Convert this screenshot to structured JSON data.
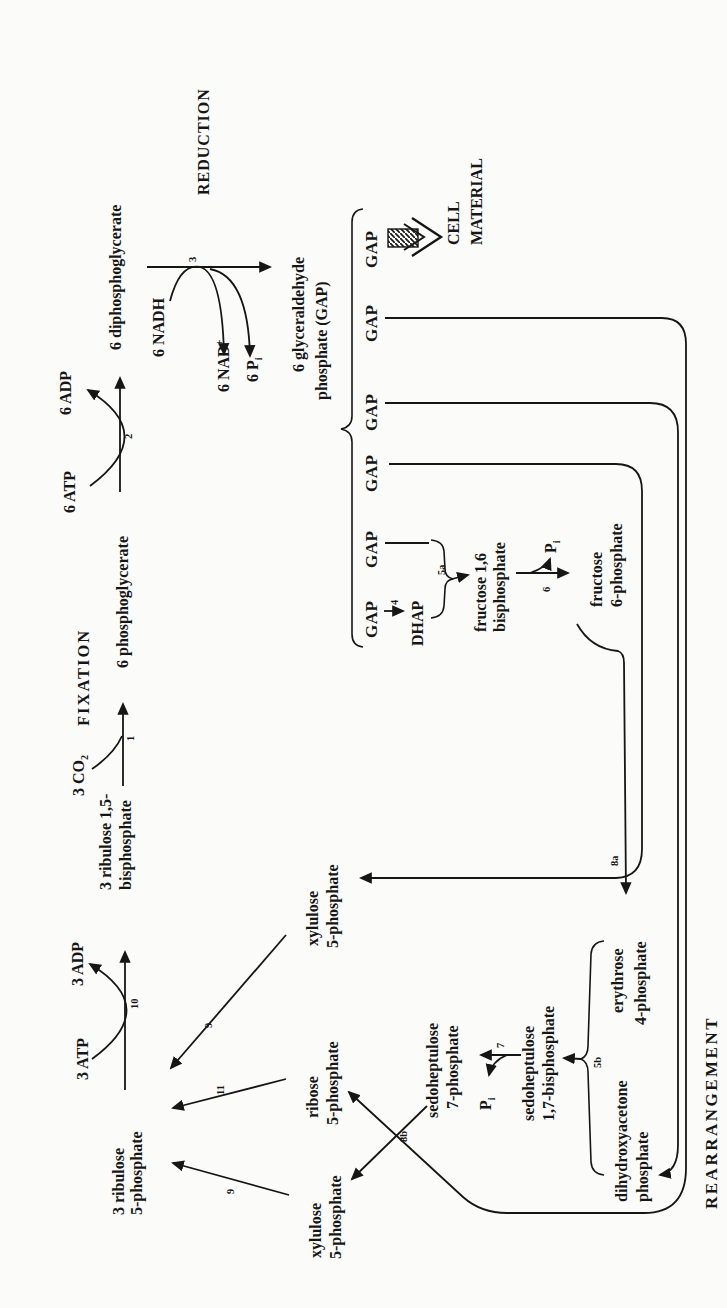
{
  "phases": {
    "fixation": "FIXATION",
    "reduction": "REDUCTION",
    "rearrangement": "REARRANGEMENT"
  },
  "main_path": {
    "ribulose5p": [
      "3 ribulose",
      "5-phosphate"
    ],
    "atp3": "3 ATP",
    "adp3": "3 ADP",
    "rubp": [
      "3 ribulose 1,5-",
      "bisphosphate"
    ],
    "co2": {
      "base": "3 CO",
      "sub": "2"
    },
    "pga": "6 phosphoglycerate",
    "atp6": "6 ATP",
    "adp6": "6 ADP",
    "dpg": "6 diphosphoglycerate",
    "nadh": "6 NADH",
    "nad": {
      "base": "6 NAD",
      "sup": "+"
    },
    "pi6": {
      "base": "6 P",
      "sub": "i"
    },
    "gap_product": [
      "6 glyceraldehyde",
      "phosphate (GAP)"
    ]
  },
  "gap_row": [
    "GAP",
    "GAP",
    "GAP",
    "GAP",
    "GAP",
    "GAP"
  ],
  "cell_material": [
    "CELL",
    "MATERIAL"
  ],
  "rearrangement": {
    "dhap": "DHAP",
    "fbp": [
      "fructose 1,6",
      "bisphosphate"
    ],
    "pi_f": {
      "base": "P",
      "sub": "i"
    },
    "f6p": [
      "fructose",
      "6-phosphate"
    ],
    "xylulose_right": [
      "xylulose",
      "5-phosphate"
    ],
    "ribose": [
      "ribose",
      "5-phosphate"
    ],
    "xylulose_left": [
      "xylulose",
      "5-phosphate"
    ],
    "s7p": [
      "sedoheptulose",
      "7-phosphate"
    ],
    "pi_s": {
      "base": "P",
      "sub": "i"
    },
    "sbp": [
      "sedoheptulose",
      "1,7-bisphosphate"
    ],
    "dhap_full": [
      "dihydroxyacetone",
      "phosphate"
    ],
    "e4p": [
      "erythrose",
      "4-phosphate"
    ]
  },
  "steps": {
    "s1": "1",
    "s2": "2",
    "s3": "3",
    "s4": "4",
    "s5a": "5a",
    "s5b": "5b",
    "s6": "6",
    "s7": "7",
    "s8a": "8a",
    "s8b": "8b",
    "s9a": "9",
    "s9b": "9",
    "s10": "10",
    "s11": "11"
  }
}
